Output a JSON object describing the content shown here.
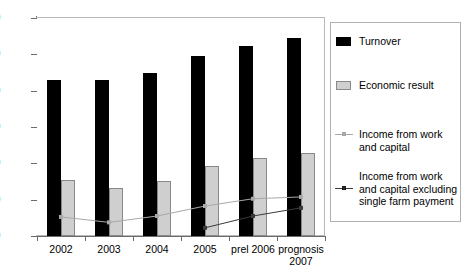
{
  "chart_data": {
    "type": "bar",
    "title": "",
    "subtitle": "",
    "xlabel": "",
    "ylabel": "",
    "ylim": [
      0,
      1200
    ],
    "yticks": [
      0,
      200,
      400,
      600,
      800,
      1000,
      1200
    ],
    "ytick_labels": [
      "0",
      "200",
      "400",
      "600",
      "800",
      "1000",
      "1200"
    ],
    "grid": false,
    "legend_position": "right",
    "categories": [
      "2002",
      "2003",
      "2004",
      "2005",
      "prel 2006",
      "prognosis 2007"
    ],
    "series": [
      {
        "name": "Turnover",
        "kind": "bar",
        "color": "#000000",
        "values": [
          860,
          860,
          900,
          990,
          1045,
          1090
        ]
      },
      {
        "name": "Economic result",
        "kind": "bar",
        "color": "#cfcfcf",
        "values": [
          310,
          265,
          305,
          385,
          430,
          455
        ]
      },
      {
        "name": "Income from work and capital",
        "kind": "line",
        "color": "#a9a9a9",
        "values": [
          105,
          75,
          110,
          165,
          205,
          215
        ]
      },
      {
        "name": "Income from work and capital excluding single farm payment",
        "kind": "line",
        "color": "#3a3a3a",
        "values": [
          null,
          null,
          null,
          45,
          110,
          155
        ]
      }
    ]
  },
  "legend": {
    "items": [
      {
        "label": "Turnover",
        "marker": "swatch-black"
      },
      {
        "label": "Economic result",
        "marker": "swatch-gray"
      },
      {
        "label": "Income from work and capital",
        "marker": "line-light"
      },
      {
        "label": "Income from work and capital excluding single farm payment",
        "marker": "line-dark"
      }
    ]
  },
  "axis": {
    "x_labels": [
      "2002",
      "2003",
      "2004",
      "2005",
      "prel 2006",
      "prognosis 2007"
    ],
    "y_labels": [
      "1200",
      "1000",
      "800",
      "600",
      "400",
      "200",
      "0"
    ]
  }
}
